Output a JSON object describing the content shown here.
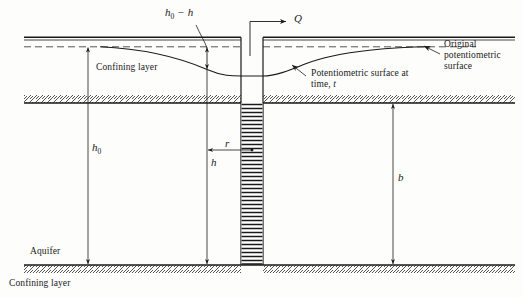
{
  "figure": {
    "type": "hydrogeology-cross-section"
  },
  "labels": {
    "drawdown_symbol": "h",
    "drawdown_symbol_sub": "0",
    "drawdown_symbol_suffix": " − h",
    "discharge": "Q",
    "confining_layer_top": "Confining layer",
    "confining_layer_bottom": "Confining layer",
    "aquifer": "Aquifer",
    "potentiometric_time_line1": "Potentiometric surface at",
    "potentiometric_time_line2_prefix": "time, ",
    "potentiometric_time_line2_var": "t",
    "original_line1": "Original",
    "original_line2": "potentiometric",
    "original_line3": "surface",
    "h_zero": "h",
    "h_zero_sub": "0",
    "h": "h",
    "r": "r",
    "b": "b"
  },
  "colors": {
    "line": "#1a1a1a",
    "hatch": "#2a2a2a",
    "background": "#fdfdfc",
    "dashed": "#444444"
  },
  "geometry": {
    "ground_surface_y": 38,
    "original_potentiometric_y": 47,
    "aquifer_top_y": 103,
    "aquifer_bottom_y": 265,
    "well_left_x": 241,
    "well_right_x": 263,
    "well_water_level_y": 76,
    "observation_line_x": 207,
    "b_dimension_x": 393,
    "h0_dimension_x": 88
  }
}
